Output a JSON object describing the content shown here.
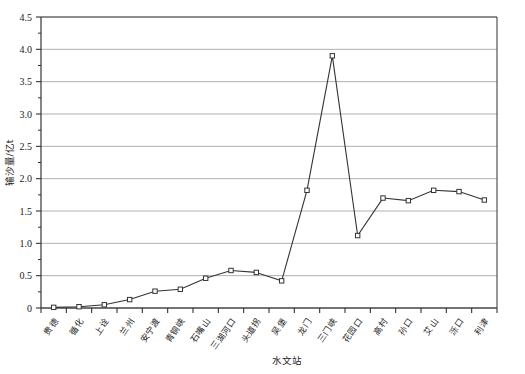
{
  "chart_data": {
    "type": "line",
    "title": "",
    "xlabel": "水文站",
    "ylabel": "输沙量/亿t",
    "ylim": [
      0,
      4.5
    ],
    "ytick_labels": [
      "0",
      "0.5",
      "1.0",
      "1.5",
      "2.0",
      "2.5",
      "3.0",
      "3.5",
      "4.0",
      "4.5"
    ],
    "ytick_values": [
      0,
      0.5,
      1.0,
      1.5,
      2.0,
      2.5,
      3.0,
      3.5,
      4.0,
      4.5
    ],
    "grid": true,
    "legend": "none",
    "marker": "open-square",
    "line_color": "#333333",
    "grid_color": "#b0b0b0",
    "categories": [
      "贵德",
      "循化",
      "上诠",
      "兰州",
      "安宁渡",
      "青铜峡",
      "石嘴山",
      "三湖河口",
      "头道拐",
      "吴堡",
      "龙门",
      "三门峡",
      "花园口",
      "高村",
      "孙口",
      "艾山",
      "泺口",
      "利津"
    ],
    "values": [
      0.01,
      0.02,
      0.05,
      0.13,
      0.26,
      0.29,
      0.46,
      0.58,
      0.55,
      0.42,
      1.82,
      3.9,
      1.12,
      1.7,
      1.66,
      1.82,
      1.8,
      1.67
    ]
  }
}
